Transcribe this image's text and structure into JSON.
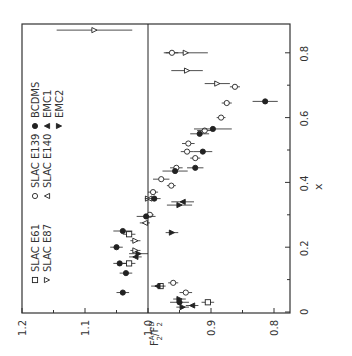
{
  "figure": {
    "orientation": "rotated 90 degrees counter-clockwise",
    "axis_color": "#333333",
    "ink_color": "#222222",
    "background": "#ffffff"
  },
  "chart_data": {
    "type": "scatter",
    "title": "",
    "xlabel": "x",
    "ylabel": "F2A / F2D",
    "ylabel_parts": {
      "main": "F",
      "sup_a": "A",
      "sub_a": "2",
      "sep": "/",
      "main2": "F",
      "sup_d": "D",
      "sub_d": "2"
    },
    "xlim": [
      0,
      0.89
    ],
    "ylim": [
      0.78,
      1.2
    ],
    "x_ticks": [
      0,
      0.2,
      0.4,
      0.6,
      0.8
    ],
    "x_tick_labels": [
      "0",
      "0.2",
      "0.4",
      "0.6",
      "0.8"
    ],
    "x_minor_ticks": [
      0.1,
      0.3,
      0.5,
      0.7
    ],
    "y_ticks": [
      0.8,
      0.9,
      1.0,
      1.1,
      1.2
    ],
    "y_tick_labels": [
      "0.8",
      "0.9",
      "1.0",
      "1.1",
      "1.2"
    ],
    "y_minor_ticks": [
      0.85,
      0.95,
      1.05,
      1.15
    ],
    "reference_line": {
      "y": 1.0
    },
    "grid": false,
    "legend": [
      {
        "label": "SLAC E61",
        "marker": "square-open",
        "glyph": "□"
      },
      {
        "label": "SLAC E87",
        "marker": "triangle-down-open",
        "glyph": "▿"
      },
      {
        "label": "SLAC E139",
        "marker": "circle-open",
        "glyph": "○"
      },
      {
        "label": "SLAC E140",
        "marker": "triangle-up-open",
        "glyph": "△"
      },
      {
        "label": "BCDMS",
        "marker": "circle-filled",
        "glyph": "●"
      },
      {
        "label": "EMC1",
        "marker": "triangle-up-filled",
        "glyph": "▲"
      },
      {
        "label": "EMC2",
        "marker": "triangle-down-filled",
        "glyph": "▼"
      }
    ],
    "legend_position": "upper-left of rotated frame (left side of image)",
    "series": [
      {
        "name": "SLAC E61",
        "marker": "square-open",
        "points": [
          {
            "x": 0.03,
            "y": 0.905,
            "err": 0.01
          },
          {
            "x": 0.08,
            "y": 0.98,
            "err": 0.008
          },
          {
            "x": 0.15,
            "y": 1.03,
            "err": 0.01
          },
          {
            "x": 0.24,
            "y": 1.03,
            "err": 0.01
          }
        ]
      },
      {
        "name": "SLAC E87",
        "marker": "triangle-down-open",
        "points": [
          {
            "x": 0.87,
            "y": 1.085,
            "err": 0.06
          },
          {
            "x": 0.8,
            "y": 0.94,
            "err": 0.035
          },
          {
            "x": 0.745,
            "y": 0.938,
            "err": 0.025
          },
          {
            "x": 0.705,
            "y": 0.89,
            "err": 0.02
          },
          {
            "x": 0.35,
            "y": 1.0,
            "err": 0.005
          },
          {
            "x": 0.22,
            "y": 1.02,
            "err": 0.008
          },
          {
            "x": 0.19,
            "y": 1.02,
            "err": 0.008
          }
        ]
      },
      {
        "name": "SLAC E139",
        "marker": "circle-open",
        "points": [
          {
            "x": 0.8,
            "y": 0.962,
            "err": 0.01
          },
          {
            "x": 0.695,
            "y": 0.862,
            "err": 0.008
          },
          {
            "x": 0.645,
            "y": 0.875,
            "err": 0.008
          },
          {
            "x": 0.6,
            "y": 0.884,
            "err": 0.007
          },
          {
            "x": 0.56,
            "y": 0.91,
            "err": 0.012
          },
          {
            "x": 0.52,
            "y": 0.936,
            "err": 0.01
          },
          {
            "x": 0.495,
            "y": 0.938,
            "err": 0.01
          },
          {
            "x": 0.475,
            "y": 0.925,
            "err": 0.008
          },
          {
            "x": 0.445,
            "y": 0.955,
            "err": 0.01
          },
          {
            "x": 0.41,
            "y": 0.979,
            "err": 0.013
          },
          {
            "x": 0.39,
            "y": 0.963,
            "err": 0.007
          },
          {
            "x": 0.37,
            "y": 0.992,
            "err": 0.008
          },
          {
            "x": 0.3,
            "y": 0.997,
            "err": 0.006
          },
          {
            "x": 0.06,
            "y": 0.94,
            "err": 0.01
          },
          {
            "x": 0.09,
            "y": 0.96,
            "err": 0.008
          }
        ]
      },
      {
        "name": "SLAC E140",
        "marker": "triangle-up-open",
        "points": [
          {
            "x": 0.35,
            "y": 0.998,
            "err": 0.006
          },
          {
            "x": 0.275,
            "y": 1.005,
            "err": 0.008
          }
        ]
      },
      {
        "name": "BCDMS",
        "marker": "circle-filled",
        "points": [
          {
            "x": 0.65,
            "y": 0.814,
            "err": 0.02
          },
          {
            "x": 0.565,
            "y": 0.897,
            "err": 0.03
          },
          {
            "x": 0.55,
            "y": 0.918,
            "err": 0.015
          },
          {
            "x": 0.495,
            "y": 0.913,
            "err": 0.015
          },
          {
            "x": 0.445,
            "y": 0.925,
            "err": 0.013
          },
          {
            "x": 0.435,
            "y": 0.957,
            "err": 0.02
          },
          {
            "x": 0.35,
            "y": 0.99,
            "err": 0.01
          },
          {
            "x": 0.295,
            "y": 1.003,
            "err": 0.015
          },
          {
            "x": 0.25,
            "y": 1.04,
            "err": 0.015
          },
          {
            "x": 0.2,
            "y": 1.05,
            "err": 0.01
          },
          {
            "x": 0.15,
            "y": 1.045,
            "err": 0.01
          },
          {
            "x": 0.12,
            "y": 1.035,
            "err": 0.01
          },
          {
            "x": 0.06,
            "y": 1.04,
            "err": 0.01
          },
          {
            "x": 0.03,
            "y": 0.95,
            "err": 0.015
          }
        ]
      },
      {
        "name": "EMC1",
        "marker": "triangle-up-filled",
        "points": [
          {
            "x": 0.34,
            "y": 0.945,
            "err": 0.018
          },
          {
            "x": 0.17,
            "y": 1.02,
            "err": 0.01
          },
          {
            "x": 0.08,
            "y": 0.985,
            "err": 0.01
          },
          {
            "x": 0.02,
            "y": 0.93,
            "err": 0.01
          }
        ]
      },
      {
        "name": "EMC2",
        "marker": "triangle-down-filled",
        "points": [
          {
            "x": 0.33,
            "y": 0.95,
            "err": 0.02
          },
          {
            "x": 0.245,
            "y": 0.962,
            "err": 0.01
          },
          {
            "x": 0.18,
            "y": 1.015,
            "err": 0.015
          },
          {
            "x": 0.04,
            "y": 0.95,
            "err": 0.01
          },
          {
            "x": 0.015,
            "y": 0.945,
            "err": 0.01
          }
        ]
      }
    ]
  }
}
